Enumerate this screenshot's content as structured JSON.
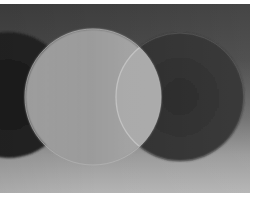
{
  "image": {
    "description": "Grayscale photograph of three overlapping discs on a gradient background",
    "colors": {
      "background_top": "#3e3e3e",
      "background_bottom": "#b4b4b4",
      "left_disc": "#1e1e1e",
      "center_disc": "#a6a6a6",
      "right_disc": "#2e2e2e",
      "overlap": "#a9a9a9",
      "rim": "#bdbdbd"
    },
    "discs": [
      {
        "name": "left-dark-disc",
        "cx": 8,
        "cy": 91,
        "r": 63
      },
      {
        "name": "center-light-disc",
        "cx": 93,
        "cy": 93,
        "r": 68
      },
      {
        "name": "right-dark-disc",
        "cx": 180,
        "cy": 93,
        "r": 64
      }
    ]
  }
}
